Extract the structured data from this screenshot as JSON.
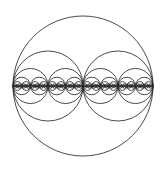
{
  "figure": {
    "kind": "recursive-circle-fractal",
    "background_color": "#ffffff",
    "stroke_color": "#2b2b2b",
    "stroke_width": 0.85,
    "canvas": {
      "width": 165,
      "height": 174
    }
  },
  "chart_data": {
    "type": "scatter",
    "title": "",
    "subtitle": "",
    "xlabel": "",
    "ylabel": "",
    "grid": false,
    "legend": null,
    "xlim": [
      0,
      165
    ],
    "ylim": [
      0,
      174
    ],
    "annotations": [],
    "construction": {
      "rule": "each circle of radius r centered at (cx, cy) is subdivided into two circles of radius r/2 centered at (cx - r/2, cy) and (cx + r/2, cy)",
      "axis_y": 86,
      "levels": 6,
      "root": {
        "cx": 83,
        "cy": 86,
        "r": 70
      }
    },
    "circles": [
      {
        "level": 0,
        "cx": 83,
        "cy": 86,
        "r": 70
      },
      {
        "level": 1,
        "cx": 48,
        "cy": 86,
        "r": 35
      },
      {
        "level": 1,
        "cx": 118,
        "cy": 86,
        "r": 35
      },
      {
        "level": 2,
        "cx": 30.5,
        "cy": 86,
        "r": 17.5
      },
      {
        "level": 2,
        "cx": 65.5,
        "cy": 86,
        "r": 17.5
      },
      {
        "level": 2,
        "cx": 100.5,
        "cy": 86,
        "r": 17.5
      },
      {
        "level": 2,
        "cx": 135.5,
        "cy": 86,
        "r": 17.5
      },
      {
        "level": 3,
        "cx": 21.75,
        "cy": 86,
        "r": 8.75
      },
      {
        "level": 3,
        "cx": 39.25,
        "cy": 86,
        "r": 8.75
      },
      {
        "level": 3,
        "cx": 56.75,
        "cy": 86,
        "r": 8.75
      },
      {
        "level": 3,
        "cx": 74.25,
        "cy": 86,
        "r": 8.75
      },
      {
        "level": 3,
        "cx": 91.75,
        "cy": 86,
        "r": 8.75
      },
      {
        "level": 3,
        "cx": 109.25,
        "cy": 86,
        "r": 8.75
      },
      {
        "level": 3,
        "cx": 126.75,
        "cy": 86,
        "r": 8.75
      },
      {
        "level": 3,
        "cx": 144.25,
        "cy": 86,
        "r": 8.75
      },
      {
        "level": 4,
        "cx": 17.375,
        "cy": 86,
        "r": 4.375
      },
      {
        "level": 4,
        "cx": 26.125,
        "cy": 86,
        "r": 4.375
      },
      {
        "level": 4,
        "cx": 34.875,
        "cy": 86,
        "r": 4.375
      },
      {
        "level": 4,
        "cx": 43.625,
        "cy": 86,
        "r": 4.375
      },
      {
        "level": 4,
        "cx": 52.375,
        "cy": 86,
        "r": 4.375
      },
      {
        "level": 4,
        "cx": 61.125,
        "cy": 86,
        "r": 4.375
      },
      {
        "level": 4,
        "cx": 69.875,
        "cy": 86,
        "r": 4.375
      },
      {
        "level": 4,
        "cx": 78.625,
        "cy": 86,
        "r": 4.375
      },
      {
        "level": 4,
        "cx": 87.375,
        "cy": 86,
        "r": 4.375
      },
      {
        "level": 4,
        "cx": 96.125,
        "cy": 86,
        "r": 4.375
      },
      {
        "level": 4,
        "cx": 104.875,
        "cy": 86,
        "r": 4.375
      },
      {
        "level": 4,
        "cx": 113.625,
        "cy": 86,
        "r": 4.375
      },
      {
        "level": 4,
        "cx": 122.375,
        "cy": 86,
        "r": 4.375
      },
      {
        "level": 4,
        "cx": 131.125,
        "cy": 86,
        "r": 4.375
      },
      {
        "level": 4,
        "cx": 139.875,
        "cy": 86,
        "r": 4.375
      },
      {
        "level": 4,
        "cx": 148.625,
        "cy": 86,
        "r": 4.375
      },
      {
        "level": 5,
        "cx": 15.1875,
        "cy": 86,
        "r": 2.1875
      },
      {
        "level": 5,
        "cx": 19.5625,
        "cy": 86,
        "r": 2.1875
      },
      {
        "level": 5,
        "cx": 23.9375,
        "cy": 86,
        "r": 2.1875
      },
      {
        "level": 5,
        "cx": 28.3125,
        "cy": 86,
        "r": 2.1875
      },
      {
        "level": 5,
        "cx": 32.6875,
        "cy": 86,
        "r": 2.1875
      },
      {
        "level": 5,
        "cx": 37.0625,
        "cy": 86,
        "r": 2.1875
      },
      {
        "level": 5,
        "cx": 41.4375,
        "cy": 86,
        "r": 2.1875
      },
      {
        "level": 5,
        "cx": 45.8125,
        "cy": 86,
        "r": 2.1875
      },
      {
        "level": 5,
        "cx": 50.1875,
        "cy": 86,
        "r": 2.1875
      },
      {
        "level": 5,
        "cx": 54.5625,
        "cy": 86,
        "r": 2.1875
      },
      {
        "level": 5,
        "cx": 58.9375,
        "cy": 86,
        "r": 2.1875
      },
      {
        "level": 5,
        "cx": 63.3125,
        "cy": 86,
        "r": 2.1875
      },
      {
        "level": 5,
        "cx": 67.6875,
        "cy": 86,
        "r": 2.1875
      },
      {
        "level": 5,
        "cx": 72.0625,
        "cy": 86,
        "r": 2.1875
      },
      {
        "level": 5,
        "cx": 76.4375,
        "cy": 86,
        "r": 2.1875
      },
      {
        "level": 5,
        "cx": 80.8125,
        "cy": 86,
        "r": 2.1875
      },
      {
        "level": 5,
        "cx": 85.1875,
        "cy": 86,
        "r": 2.1875
      },
      {
        "level": 5,
        "cx": 89.5625,
        "cy": 86,
        "r": 2.1875
      },
      {
        "level": 5,
        "cx": 93.9375,
        "cy": 86,
        "r": 2.1875
      },
      {
        "level": 5,
        "cx": 98.3125,
        "cy": 86,
        "r": 2.1875
      },
      {
        "level": 5,
        "cx": 102.6875,
        "cy": 86,
        "r": 2.1875
      },
      {
        "level": 5,
        "cx": 107.0625,
        "cy": 86,
        "r": 2.1875
      },
      {
        "level": 5,
        "cx": 111.4375,
        "cy": 86,
        "r": 2.1875
      },
      {
        "level": 5,
        "cx": 115.8125,
        "cy": 86,
        "r": 2.1875
      },
      {
        "level": 5,
        "cx": 120.1875,
        "cy": 86,
        "r": 2.1875
      },
      {
        "level": 5,
        "cx": 124.5625,
        "cy": 86,
        "r": 2.1875
      },
      {
        "level": 5,
        "cx": 128.9375,
        "cy": 86,
        "r": 2.1875
      },
      {
        "level": 5,
        "cx": 133.3125,
        "cy": 86,
        "r": 2.1875
      },
      {
        "level": 5,
        "cx": 137.6875,
        "cy": 86,
        "r": 2.1875
      },
      {
        "level": 5,
        "cx": 142.0625,
        "cy": 86,
        "r": 2.1875
      },
      {
        "level": 5,
        "cx": 146.4375,
        "cy": 86,
        "r": 2.1875
      },
      {
        "level": 5,
        "cx": 150.8125,
        "cy": 86,
        "r": 2.1875
      }
    ]
  }
}
